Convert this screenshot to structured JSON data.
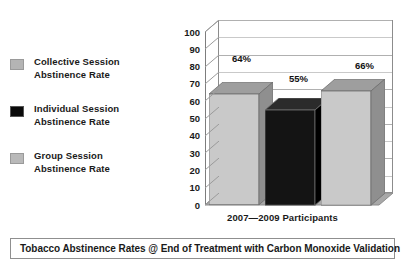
{
  "top_ghost_text": "",
  "legend": {
    "items": [
      {
        "label_line1": "Collective Session",
        "label_line2": "Abstinence Rate",
        "swatch": "gray-swatch-icon",
        "color": "#b4b4b4"
      },
      {
        "label_line1": "Individual Session",
        "label_line2": "Abstinence Rate",
        "swatch": "black-swatch-icon",
        "color": "#0a0a0a"
      },
      {
        "label_line1": "Group Session",
        "label_line2": "Abstinence Rate",
        "swatch": "gray-swatch-icon",
        "color": "#b9b9b9"
      }
    ]
  },
  "chart_data": {
    "type": "bar",
    "title": "",
    "xlabel": "2007—2009 Participants",
    "ylabel": "",
    "ylim": [
      0,
      100
    ],
    "yticks": [
      100,
      90,
      80,
      70,
      60,
      50,
      40,
      30,
      20,
      10,
      0
    ],
    "grid": true,
    "legend_position": "left",
    "categories": [
      "Collective Session Abstinence Rate",
      "Individual Session Abstinence Rate",
      "Group Session Abstinence Rate"
    ],
    "values": [
      64,
      55,
      66
    ],
    "data_labels": [
      "64%",
      "55%",
      "66%"
    ],
    "colors": [
      "#c9c9c9",
      "#141414",
      "#c9c9c9"
    ]
  },
  "caption": {
    "text": "Tobacco Abstinence Rates @ End of Treatment with Carbon Monoxide Validation"
  }
}
